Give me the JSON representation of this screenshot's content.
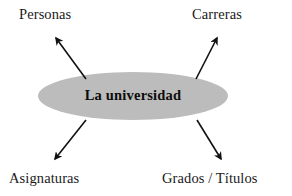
{
  "diagram": {
    "type": "concept-map",
    "background_color": "#ffffff",
    "center": {
      "label": "La universidad",
      "shape": "ellipse",
      "fill_color": "#bcbcbc",
      "text_color": "#0d0d0d",
      "cx": 133,
      "cy": 96,
      "rx": 95,
      "ry": 24
    },
    "nodes": [
      {
        "id": "personas",
        "label": "Personas",
        "position": "top-left"
      },
      {
        "id": "carreras",
        "label": "Carreras",
        "position": "top-right"
      },
      {
        "id": "asignaturas",
        "label": "Asignaturas",
        "position": "bottom-left"
      },
      {
        "id": "grados-titulos",
        "label": "Grados / Títulos",
        "position": "bottom-right"
      }
    ],
    "arrows": [
      {
        "id": "arrow-to-personas",
        "from": "center",
        "to": "personas",
        "direction": "up-left",
        "color": "#111111"
      },
      {
        "id": "arrow-to-carreras",
        "from": "center",
        "to": "carreras",
        "direction": "up-right",
        "color": "#111111"
      },
      {
        "id": "arrow-to-asignaturas",
        "from": "center",
        "to": "asignaturas",
        "direction": "down-left",
        "color": "#111111"
      },
      {
        "id": "arrow-to-grados-titulos",
        "from": "center",
        "to": "grados-titulos",
        "direction": "down-right",
        "color": "#111111"
      }
    ]
  }
}
